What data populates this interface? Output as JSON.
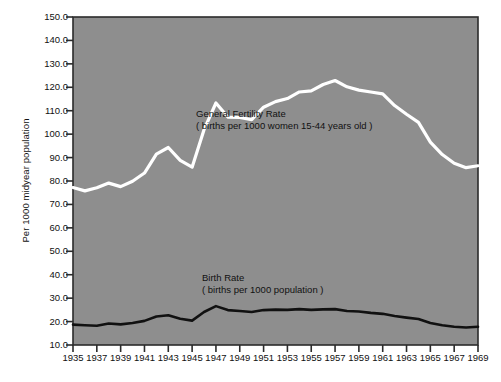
{
  "chart_data": {
    "type": "line",
    "title": "",
    "xlabel": "",
    "ylabel": "Per 1000 midyear population",
    "xlim": [
      1935,
      1969
    ],
    "ylim": [
      10.0,
      150.0
    ],
    "grid": false,
    "legend_position": "inline-annotation",
    "background_color": "#8e8e8e",
    "x_tick_labels": [
      "1935",
      "1937",
      "1939",
      "1941",
      "1943",
      "1945",
      "1947",
      "1949",
      "1951",
      "1953",
      "1955",
      "1957",
      "1959",
      "1961",
      "1963",
      "1965",
      "1967",
      "1969"
    ],
    "x_tick_values": [
      1935,
      1937,
      1939,
      1941,
      1943,
      1945,
      1947,
      1949,
      1951,
      1953,
      1955,
      1957,
      1959,
      1961,
      1963,
      1965,
      1967,
      1969
    ],
    "y_tick_labels": [
      "10.0",
      "20.0",
      "30.0",
      "40.0",
      "50.0",
      "60.0",
      "70.0",
      "80.0",
      "90.0",
      "100.0",
      "110.0",
      "120.0",
      "130.0",
      "140.0",
      "150.0"
    ],
    "y_tick_values": [
      10,
      20,
      30,
      40,
      50,
      60,
      70,
      80,
      90,
      100,
      110,
      120,
      130,
      140,
      150
    ],
    "x": [
      1935,
      1936,
      1937,
      1938,
      1939,
      1940,
      1941,
      1942,
      1943,
      1944,
      1945,
      1946,
      1947,
      1948,
      1949,
      1950,
      1951,
      1952,
      1953,
      1954,
      1955,
      1956,
      1957,
      1958,
      1959,
      1960,
      1961,
      1962,
      1963,
      1964,
      1965,
      1966,
      1967,
      1968,
      1969
    ],
    "series": [
      {
        "name": "General Fertility Rate",
        "annotation_line1": "General Fertility Rate",
        "annotation_line2": "( births per 1000 women 15-44 years old )",
        "color": "#ffffff",
        "line_width": 3.2,
        "values": [
          77.2,
          75.8,
          77.1,
          79.1,
          77.6,
          79.9,
          83.4,
          91.5,
          94.3,
          88.8,
          85.9,
          101.9,
          113.3,
          107.3,
          107.1,
          106.2,
          111.5,
          113.9,
          115.2,
          118.0,
          118.5,
          121.2,
          122.9,
          120.2,
          118.8,
          118.0,
          117.2,
          112.2,
          108.5,
          105.0,
          96.6,
          91.3,
          87.6,
          85.7,
          86.5
        ]
      },
      {
        "name": "Birth Rate",
        "annotation_line1": "Birth Rate",
        "annotation_line2": "( births per 1000 population )",
        "color": "#111111",
        "line_width": 2.6,
        "values": [
          18.7,
          18.4,
          18.2,
          19.2,
          18.8,
          19.4,
          20.3,
          22.2,
          22.7,
          21.2,
          20.4,
          24.1,
          26.6,
          24.9,
          24.5,
          24.1,
          24.9,
          25.1,
          25.0,
          25.3,
          25.0,
          25.2,
          25.3,
          24.5,
          24.3,
          23.7,
          23.3,
          22.4,
          21.7,
          21.1,
          19.4,
          18.4,
          17.8,
          17.5,
          17.8
        ]
      }
    ]
  },
  "axes": {
    "ylabel": "Per 1000 midyear population"
  }
}
